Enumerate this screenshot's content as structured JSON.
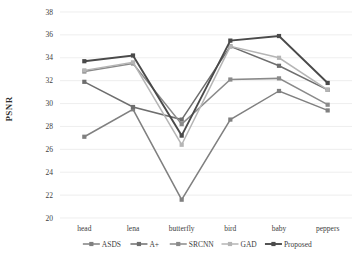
{
  "chart_data": {
    "type": "line",
    "title": "",
    "xlabel": "",
    "ylabel": "PSNR",
    "categories": [
      "head",
      "lena",
      "butterfly",
      "bird",
      "baby",
      "peppers"
    ],
    "ylim": [
      20,
      38
    ],
    "yticks": [
      20,
      22,
      24,
      26,
      28,
      30,
      32,
      34,
      36,
      38
    ],
    "grid": true,
    "legend_position": "bottom",
    "series": [
      {
        "name": "ASDS",
        "color": "#808080",
        "values": [
          27.1,
          29.5,
          21.6,
          28.6,
          31.1,
          29.4
        ]
      },
      {
        "name": "A+",
        "color": "#6e6e6e",
        "values": [
          31.9,
          29.7,
          28.6,
          35.0,
          33.3,
          31.2
        ]
      },
      {
        "name": "SRCNN",
        "color": "#8a8a8a",
        "values": [
          32.8,
          33.5,
          28.2,
          32.1,
          32.2,
          29.9
        ]
      },
      {
        "name": "GAD",
        "color": "#b5b5b5",
        "values": [
          32.9,
          33.6,
          26.4,
          35.0,
          34.0,
          31.2
        ]
      },
      {
        "name": "Proposed",
        "color": "#4a4a4a",
        "values": [
          33.7,
          34.2,
          27.2,
          35.5,
          35.9,
          31.8
        ]
      }
    ]
  },
  "axis": {
    "y_title": "PSNR"
  }
}
